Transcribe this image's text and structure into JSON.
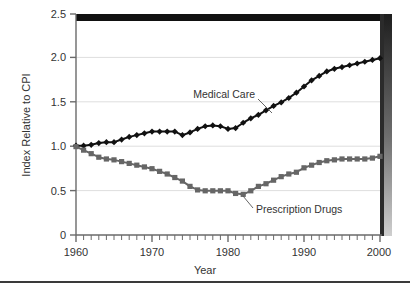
{
  "chart_data": {
    "type": "line",
    "title": "",
    "xlabel": "Year",
    "ylabel": "Index Relative to CPI",
    "xlim": [
      1960,
      2000
    ],
    "ylim": [
      0,
      2.5
    ],
    "grid": true,
    "legend_position": "inline-annotations",
    "x_tick_labels": [
      "1960",
      "1970",
      "1980",
      "1990",
      "2000"
    ],
    "x_tick_values": [
      1960,
      1970,
      1980,
      1990,
      2000
    ],
    "x_minor_tick_interval": 1,
    "y_tick_labels": [
      "0",
      "0.5",
      "1.0",
      "1.5",
      "2.0",
      "2.5"
    ],
    "y_tick_values": [
      0,
      0.5,
      1.0,
      1.5,
      2.0,
      2.5
    ],
    "x": [
      1960,
      1961,
      1962,
      1963,
      1964,
      1965,
      1966,
      1967,
      1968,
      1969,
      1970,
      1971,
      1972,
      1973,
      1974,
      1975,
      1976,
      1977,
      1978,
      1979,
      1980,
      1981,
      1982,
      1983,
      1984,
      1985,
      1986,
      1987,
      1988,
      1989,
      1990,
      1991,
      1992,
      1993,
      1994,
      1995,
      1996,
      1997,
      1998,
      1999,
      2000
    ],
    "series": [
      {
        "name": "Medical Care",
        "color": "#111111",
        "marker": "diamond",
        "values": [
          1.01,
          1.01,
          1.02,
          1.04,
          1.05,
          1.05,
          1.08,
          1.11,
          1.13,
          1.15,
          1.17,
          1.17,
          1.17,
          1.17,
          1.13,
          1.16,
          1.2,
          1.23,
          1.24,
          1.23,
          1.2,
          1.21,
          1.27,
          1.32,
          1.36,
          1.41,
          1.46,
          1.5,
          1.55,
          1.61,
          1.68,
          1.75,
          1.8,
          1.85,
          1.88,
          1.9,
          1.92,
          1.94,
          1.96,
          1.98,
          2.0
        ]
      },
      {
        "name": "Prescription Drugs",
        "color": "#666666",
        "marker": "square",
        "values": [
          1.0,
          0.96,
          0.92,
          0.88,
          0.86,
          0.85,
          0.83,
          0.81,
          0.79,
          0.77,
          0.75,
          0.72,
          0.69,
          0.65,
          0.61,
          0.55,
          0.51,
          0.5,
          0.5,
          0.5,
          0.5,
          0.47,
          0.46,
          0.5,
          0.55,
          0.58,
          0.62,
          0.66,
          0.69,
          0.71,
          0.76,
          0.79,
          0.82,
          0.84,
          0.85,
          0.86,
          0.86,
          0.86,
          0.86,
          0.87,
          0.89
        ]
      }
    ],
    "annotations": [
      {
        "text": "Medical Care",
        "series": "Medical Care"
      },
      {
        "text": "Prescription Drugs",
        "series": "Prescription Drugs"
      }
    ]
  },
  "style": {
    "grid_color": "#dedede",
    "axis_color": "#6a6a6a",
    "text_color": "#333333",
    "plot_background": "#ffffff",
    "frame_top_color": "#111111",
    "shadow_color": "#2b2b2b",
    "rule_color": "#3a3a3a"
  }
}
